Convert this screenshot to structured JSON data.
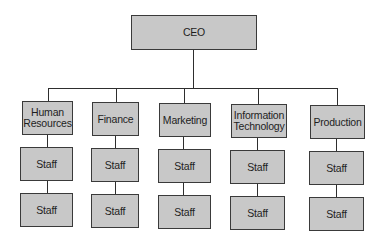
{
  "diagram": {
    "type": "org-chart",
    "root": {
      "label": "CEO"
    },
    "departments": [
      {
        "label": "Human Resources",
        "staff": [
          "Staff",
          "Staff"
        ]
      },
      {
        "label": "Finance",
        "staff": [
          "Staff",
          "Staff"
        ]
      },
      {
        "label": "Marketing",
        "staff": [
          "Staff",
          "Staff"
        ]
      },
      {
        "label": "Information Technology",
        "staff": [
          "Staff",
          "Staff"
        ]
      },
      {
        "label": "Production",
        "staff": [
          "Staff",
          "Staff"
        ]
      }
    ],
    "colors": {
      "box_fill": "#c8c8c8",
      "box_border": "#3a3a3a",
      "line": "#2e2e2e",
      "background": "#ffffff"
    }
  }
}
